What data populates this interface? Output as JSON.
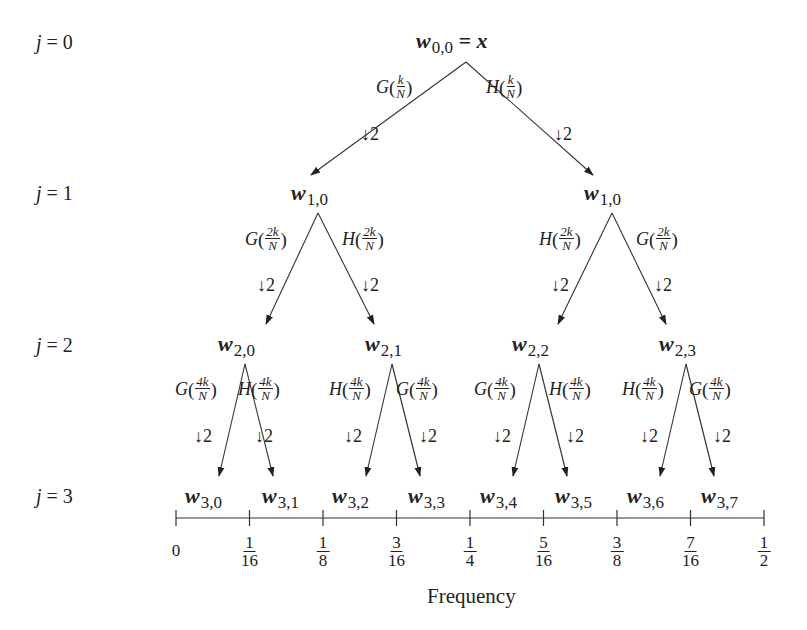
{
  "levels": [
    {
      "label": "j",
      "eq": " = 0"
    },
    {
      "label": "j",
      "eq": " = 1"
    },
    {
      "label": "j",
      "eq": " = 2"
    },
    {
      "label": "j",
      "eq": " = 3"
    }
  ],
  "root": {
    "symbol": "w",
    "sub": "0,0",
    "rest": " = x"
  },
  "nodes_level1": [
    {
      "symbol": "w",
      "sub": "1,0"
    },
    {
      "symbol": "w",
      "sub": "1,0"
    }
  ],
  "nodes_level2": [
    {
      "symbol": "w",
      "sub": "2,0"
    },
    {
      "symbol": "w",
      "sub": "2,1"
    },
    {
      "symbol": "w",
      "sub": "2,2"
    },
    {
      "symbol": "w",
      "sub": "2,3"
    }
  ],
  "nodes_level3": [
    {
      "symbol": "w",
      "sub": "3,0"
    },
    {
      "symbol": "w",
      "sub": "3,1"
    },
    {
      "symbol": "w",
      "sub": "3,2"
    },
    {
      "symbol": "w",
      "sub": "3,3"
    },
    {
      "symbol": "w",
      "sub": "3,4"
    },
    {
      "symbol": "w",
      "sub": "3,5"
    },
    {
      "symbol": "w",
      "sub": "3,6"
    },
    {
      "symbol": "w",
      "sub": "3,7"
    }
  ],
  "filters_level0": [
    {
      "name": "G",
      "num": "k",
      "den": "N",
      "down": "↓2"
    },
    {
      "name": "H",
      "num": "k",
      "den": "N",
      "down": "↓2"
    }
  ],
  "filters_level1": [
    {
      "name": "G",
      "num": "2k",
      "den": "N",
      "down": "↓2"
    },
    {
      "name": "H",
      "num": "2k",
      "den": "N",
      "down": "↓2"
    },
    {
      "name": "H",
      "num": "2k",
      "den": "N",
      "down": "↓2"
    },
    {
      "name": "G",
      "num": "2k",
      "den": "N",
      "down": "↓2"
    }
  ],
  "filters_level2": [
    {
      "name": "G",
      "num": "4k",
      "den": "N",
      "down": "↓2"
    },
    {
      "name": "H",
      "num": "4k",
      "den": "N",
      "down": "↓2"
    },
    {
      "name": "H",
      "num": "4k",
      "den": "N",
      "down": "↓2"
    },
    {
      "name": "G",
      "num": "4k",
      "den": "N",
      "down": "↓2"
    },
    {
      "name": "G",
      "num": "4k",
      "den": "N",
      "down": "↓2"
    },
    {
      "name": "H",
      "num": "4k",
      "den": "N",
      "down": "↓2"
    },
    {
      "name": "H",
      "num": "4k",
      "den": "N",
      "down": "↓2"
    },
    {
      "name": "G",
      "num": "4k",
      "den": "N",
      "down": "↓2"
    }
  ],
  "axis": {
    "ticks": [
      {
        "num": "0",
        "den": ""
      },
      {
        "num": "1",
        "den": "16"
      },
      {
        "num": "1",
        "den": "8"
      },
      {
        "num": "3",
        "den": "16"
      },
      {
        "num": "1",
        "den": "4"
      },
      {
        "num": "5",
        "den": "16"
      },
      {
        "num": "3",
        "den": "8"
      },
      {
        "num": "7",
        "den": "16"
      },
      {
        "num": "1",
        "den": "2"
      }
    ],
    "label": "Frequency"
  }
}
